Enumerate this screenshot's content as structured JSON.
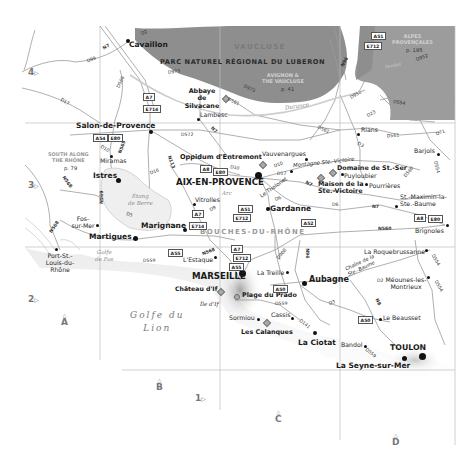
{
  "map": {
    "title": "Provence – Bouches-du-Rhône region map",
    "colors": {
      "park_fill": "#8c8c8c",
      "alpes_fill": "#9a9a9a",
      "land": "#ffffff",
      "coast_shadow": "#d8d8d8",
      "roads": "#9a9a9a",
      "grid": "#bdbdbd",
      "text": "#1a1a1a"
    },
    "grid": {
      "rows": [
        {
          "label": "4",
          "icon": "triangle-right-icon"
        },
        {
          "label": "3",
          "icon": "triangle-right-icon"
        },
        {
          "label": "2",
          "icon": "triangle-right-icon"
        },
        {
          "label": "1",
          "icon": "triangle-right-icon"
        }
      ],
      "columns": [
        {
          "label": "A",
          "icon": "triangle-up-icon"
        },
        {
          "label": "B",
          "icon": "triangle-up-icon"
        },
        {
          "label": "C",
          "icon": "triangle-up-icon"
        },
        {
          "label": "D",
          "icon": "triangle-up-icon"
        }
      ]
    },
    "regions": {
      "vaucluse": "VAUCLUSE",
      "luberon": "PARC NATUREL RÉGIONAL DU LUBERON",
      "bouches": "BOUCHES-DU-RHÔNE"
    },
    "cross_refs": {
      "avignon": {
        "line1": "AVIGNON &",
        "line2": "THE VAUCLUSE",
        "page": "p. 41"
      },
      "alpes": {
        "line1": "ALPES",
        "line2": "PROVENÇALES",
        "page": "p. 185"
      },
      "south": {
        "line1": "SOUTH ALONG",
        "line2": "THE RHÔNE",
        "page": "p. 79"
      }
    },
    "water": {
      "sea": {
        "line1": "Golfe du",
        "line2": "Lion"
      },
      "etang": {
        "line1": "Étang",
        "line2": "de Berre"
      },
      "fos": {
        "line1": "Golfe",
        "line2": "de Fos"
      },
      "durance": "Durance",
      "arc": "Arc",
      "verdon": "Verdon"
    },
    "places": {
      "cavaillon": "Cavaillon",
      "abbaye": "Abbaye de Silvacane",
      "lambesc": "Lambesc",
      "salon": "Salon-de-Provence",
      "miramas": "Miramas",
      "istres": "Istres",
      "oppidum": "Oppidum d'Entremont",
      "aix": "AIX-EN-PROVENCE",
      "vauvenargues": "Vauvenargues",
      "montagne": "Montagne Ste.-Victoire",
      "domaine": "Domaine de St.-Ser",
      "puyloubier": "Puyloubier",
      "maison": "Maison de la Ste.-Victoire",
      "pourrieres": "Pourrières",
      "rians": "Rians",
      "barjols": "Barjols",
      "stmaximin": "St.-Maximin-la-Ste.-Baume",
      "brignoles": "Brignoles",
      "tholonet": "Le Tholonet",
      "gardanne": "Gardanne",
      "vitrolles": "Vitrolles",
      "marignane": "Marignane",
      "fos": "Fos-sur-Mer",
      "martigues": "Martigues",
      "portstlouis": "Port-St.-Louis-du-Rhône",
      "estaque": "L'Estaque",
      "marseille": "MARSEILLE",
      "chateau": "Château d'If",
      "iledif": "Île d'If",
      "prado": "Plage du Prado",
      "treille": "La Treille",
      "aubagne": "Aubagne",
      "sormiou": "Sormiou",
      "cassis": "Cassis",
      "calanques": "Les Calanques",
      "ciotat": "La Ciotat",
      "bandol": "Bandol",
      "toulon": "TOULON",
      "seyne": "La Seyne-sur-Mer",
      "beausset": "Le Beausset",
      "roquebrussanne": "La Roquebrussanne",
      "meounes": "Méounes-les-Montrieux",
      "chaine": "Chaîne de la Ste.-Baume"
    },
    "roads": {
      "d2": "D2",
      "n7a": "N7",
      "d99": "D99",
      "d569": "D569",
      "d17": "D17",
      "d973a": "D973",
      "d973b": "D973",
      "d561a": "D561",
      "d561b": "D561",
      "d561c": "D561",
      "d572": "D572",
      "n7b": "N7",
      "d10a": "D10",
      "n569a": "N569",
      "n568a": "N568",
      "n113": "N113",
      "d16": "D16",
      "d10b": "D10",
      "d10c": "D10",
      "d17b": "D17",
      "n7c": "N7",
      "d6a": "D6",
      "d6b": "D6",
      "n7d": "N7",
      "n569b": "N569",
      "d5": "D5",
      "d9": "D9",
      "n568b": "N568",
      "d559a": "D559",
      "n568c": "N568",
      "d908": "D908",
      "n96a": "N96",
      "n96b": "N96",
      "d952a": "D952",
      "d952b": "D952",
      "d554": "D554",
      "d23": "D23",
      "d3a": "D3",
      "d71": "D71",
      "d560": "D560",
      "d554b": "D554",
      "n560": "N560",
      "d554c": "D554",
      "d554d": "D554",
      "d2b": "D2",
      "d3b": "D3",
      "n8": "N8",
      "d559b": "D559",
      "d141": "D141",
      "d559c": "D559"
    },
    "shields": {
      "a51a": "A51",
      "e712a": "E712",
      "a7a": "A7",
      "e714a": "E714",
      "a54": "A54",
      "e80a": "E80",
      "a8a": "A8",
      "e80b": "E80",
      "a51b": "A51",
      "e712b": "E712",
      "a52": "A52",
      "a7b": "A7",
      "e714b": "E714",
      "a55a": "A55",
      "a7c": "A7",
      "e712c": "E712",
      "a55b": "A55",
      "a50a": "A50",
      "a50b": "A50",
      "a8b": "A8",
      "e80c": "E80"
    }
  }
}
